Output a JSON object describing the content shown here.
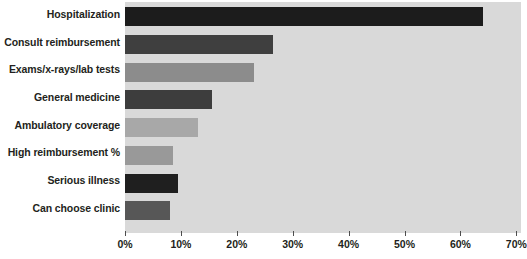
{
  "chart_data": {
    "type": "bar",
    "orientation": "horizontal",
    "title": "",
    "subtitle": "",
    "xlabel": "",
    "ylabel": "",
    "xlim": [
      0,
      70
    ],
    "grid": false,
    "legend": null,
    "xtick_labels": [
      "0%",
      "10%",
      "20%",
      "30%",
      "40%",
      "50%",
      "60%",
      "70%"
    ],
    "xtick_values": [
      0,
      10,
      20,
      30,
      40,
      50,
      60,
      70
    ],
    "categories": [
      "Hospitalization",
      "Consult reimbursement",
      "Exams/x-rays/lab tests",
      "General medicine",
      "Ambulatory coverage",
      "High reimbursement %",
      "Serious illness",
      "Can choose clinic"
    ],
    "values": [
      64,
      26.5,
      23,
      15.5,
      13,
      8.5,
      9.5,
      8
    ],
    "bar_colors": [
      "#1c1c1c",
      "#3f3f3f",
      "#8c8c8c",
      "#3d3d3d",
      "#a8a8a8",
      "#999999",
      "#1f1f1f",
      "#575757"
    ],
    "plot_background": "#d9d9d9",
    "page_background": "#ffffff",
    "text_color": "#231f20"
  }
}
